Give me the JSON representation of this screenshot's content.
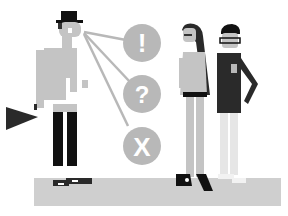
{
  "illustration": {
    "subject": "three people with decision bubbles",
    "bubbles": [
      {
        "symbol": "!",
        "meaning": "exclamation"
      },
      {
        "symbol": "?",
        "meaning": "question"
      },
      {
        "symbol": "X",
        "meaning": "cross"
      }
    ],
    "colors": {
      "background": "#ffffff",
      "floor": "#cfcfcf",
      "bubble": "#b8b8b8",
      "light_gray": "#c4c4c4",
      "dark": "#2a2a2a",
      "black": "#111111",
      "white": "#ffffff"
    }
  }
}
